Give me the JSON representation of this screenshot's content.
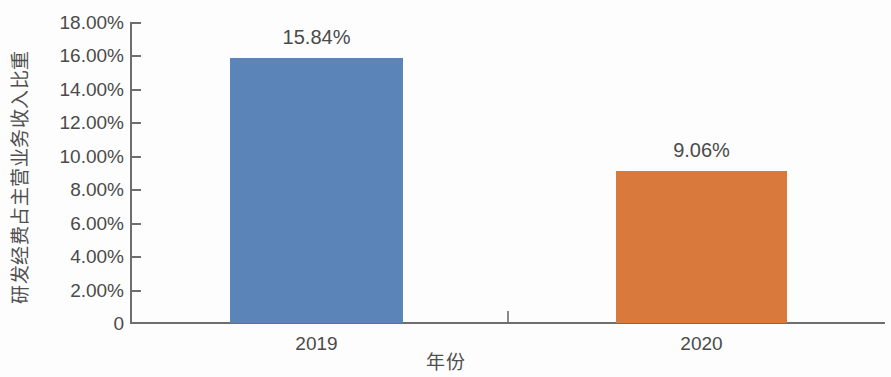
{
  "chart_data": {
    "type": "bar",
    "title": "",
    "subtitle": "",
    "xlabel": "年份",
    "ylabel": "研发经费占主营业务收入比重",
    "categories": [
      "2019",
      "2020"
    ],
    "values": [
      15.84,
      9.06
    ],
    "value_labels": [
      "15.84%",
      "9.06%"
    ],
    "bar_colors": [
      "#5b84b8",
      "#d97a3c"
    ],
    "unit": "%",
    "ylim": [
      0,
      18
    ],
    "ytick_values": [
      0,
      2,
      4,
      6,
      8,
      10,
      12,
      14,
      16,
      18
    ],
    "ytick_labels": [
      "0",
      "2.00%",
      "4.00%",
      "6.00%",
      "8.00%",
      "10.00%",
      "12.00%",
      "14.00%",
      "16.00%",
      "18.00%"
    ],
    "grid": false,
    "legend": false,
    "legend_position": "none",
    "series": [
      {
        "name": "研发经费占主营业务收入比重",
        "values": [
          15.84,
          9.06
        ]
      }
    ]
  },
  "axis_colors": {
    "axis_line": "#6e6e6e",
    "tick_text": "#4a4a4a",
    "background": "#fdfdfd"
  }
}
